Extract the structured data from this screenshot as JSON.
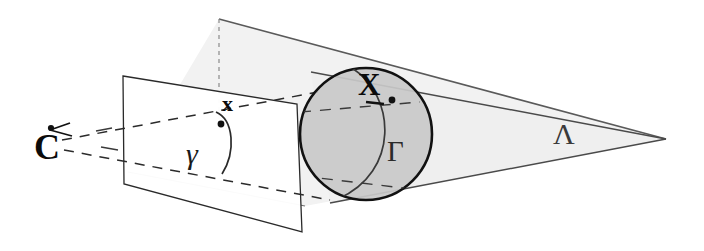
{
  "figure": {
    "background_color": "#ffffff",
    "width": 704,
    "height": 251
  },
  "labels": {
    "camera_centre": "C",
    "image_point": "x",
    "image_conic": "γ",
    "sphere_point": "X",
    "contour_generator": "Γ",
    "cone": "Λ"
  },
  "colors": {
    "stroke_dark": "#111111",
    "stroke_mid": "#555555",
    "stroke_light": "#6b6b6b",
    "sphere_fill": "#c9c9c9",
    "cone_fill": "#efefef",
    "plane_fill": "#ffffff",
    "dashed": "#333333"
  },
  "geometry": {
    "camera_centre_point": {
      "x": 56,
      "y": 138
    },
    "image_plane_quad": [
      {
        "x": 123,
        "y": 76
      },
      {
        "x": 297,
        "y": 104
      },
      {
        "x": 302,
        "y": 232
      },
      {
        "x": 124,
        "y": 184
      }
    ],
    "sphere": {
      "cx": 366,
      "cy": 134,
      "r": 66
    },
    "cone_apex": {
      "x": 666,
      "y": 139
    },
    "cone_upper_vertex": {
      "x": 219,
      "y": 19
    },
    "image_point_xy": {
      "x": 224,
      "y": 122
    },
    "sphere_point_xy": {
      "x": 392,
      "y": 100
    }
  },
  "elements": [
    {
      "name": "camera-centre",
      "label": "C",
      "kind": "point"
    },
    {
      "name": "image-plane",
      "label": "",
      "kind": "quadrilateral"
    },
    {
      "name": "image-point",
      "label": "x",
      "kind": "point"
    },
    {
      "name": "image-conic",
      "label": "γ",
      "kind": "curve"
    },
    {
      "name": "sphere",
      "label": "X",
      "kind": "sphere"
    },
    {
      "name": "contour-generator",
      "label": "Γ",
      "kind": "curve"
    },
    {
      "name": "viewing-cone",
      "label": "Λ",
      "kind": "cone"
    }
  ]
}
